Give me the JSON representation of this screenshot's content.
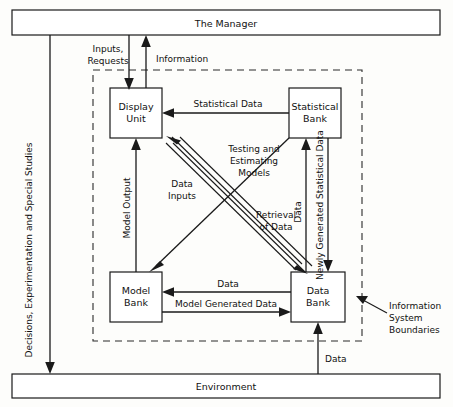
{
  "diagram": {
    "bands": {
      "manager": "The Manager",
      "environment": "Environment"
    },
    "nodes": {
      "display_unit": {
        "line1": "Display",
        "line2": "Unit"
      },
      "statistical_bank": {
        "line1": "Statistical",
        "line2": "Bank"
      },
      "model_bank": {
        "line1": "Model",
        "line2": "Bank"
      },
      "data_bank": {
        "line1": "Data",
        "line2": "Bank"
      }
    },
    "edges": {
      "inputs_requests": {
        "line1": "Inputs,",
        "line2": "Requests"
      },
      "information": "Information",
      "statistical_data_top": "Statistical Data",
      "testing_estimating_models": {
        "line1": "Testing and",
        "line2": "Estimating",
        "line3": "Models"
      },
      "data_inputs": {
        "line1": "Data",
        "line2": "Inputs"
      },
      "retrieval_of_data": {
        "line1": "Retrieval",
        "line2": "of Data"
      },
      "model_output": "Model Output",
      "data_vertical_right": "Data",
      "newly_generated_statistical_data": "Newly Generated Statistical Data",
      "data_mid": "Data",
      "model_generated_data": "Model Generated Data",
      "data_environment": "Data",
      "decisions_experimentation": "Decisions, Experimentation and Special Studies"
    },
    "annotations": {
      "information_system_boundaries": {
        "line1": "Information",
        "line2": "System",
        "line3": "Boundaries"
      }
    },
    "colors": {
      "stroke": "#1a1a1a",
      "background": "#fdfdfb",
      "boundary": "#2a2a2a"
    }
  }
}
